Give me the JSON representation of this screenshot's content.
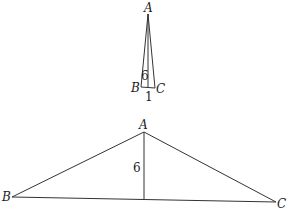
{
  "figures": [
    {
      "name": "narrow-triangle",
      "vertices": {
        "A": "A",
        "B": "B",
        "C": "C"
      },
      "height_label": "6",
      "base_label": "1"
    },
    {
      "name": "wide-triangle",
      "vertices": {
        "A": "A",
        "B": "B",
        "C": "C"
      },
      "height_label": "6"
    }
  ],
  "colors": {
    "stroke": "#333333",
    "background": "#ffffff"
  }
}
